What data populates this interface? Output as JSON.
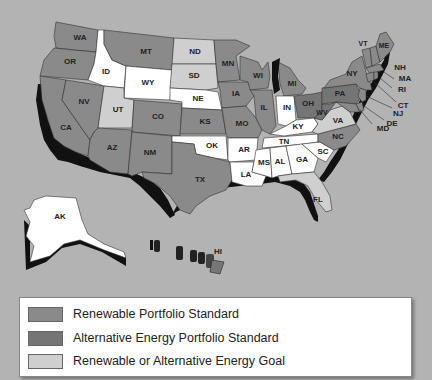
{
  "colors": {
    "background": "#b3b3b3",
    "rps": "#8a8a8a",
    "aeps": "#757575",
    "goal": "#cfcfcf",
    "none": "#ffffff",
    "shadow": "#111111"
  },
  "legend": {
    "items": [
      {
        "label": "Renewable Portfolio Standard",
        "category": "rps"
      },
      {
        "label": "Alternative Energy Portfolio Standard",
        "category": "aeps"
      },
      {
        "label": "Renewable or Alternative Energy Goal",
        "category": "goal"
      }
    ]
  },
  "states": {
    "WA": {
      "label": "WA",
      "category": "rps"
    },
    "OR": {
      "label": "OR",
      "category": "rps"
    },
    "CA": {
      "label": "CA",
      "category": "rps"
    },
    "NV": {
      "label": "NV",
      "category": "rps"
    },
    "ID": {
      "label": "ID",
      "category": "none"
    },
    "MT": {
      "label": "MT",
      "category": "rps"
    },
    "WY": {
      "label": "WY",
      "category": "none"
    },
    "UT": {
      "label": "UT",
      "category": "goal"
    },
    "AZ": {
      "label": "AZ",
      "category": "rps"
    },
    "CO": {
      "label": "CO",
      "category": "rps"
    },
    "NM": {
      "label": "NM",
      "category": "rps"
    },
    "ND": {
      "label": "ND",
      "category": "goal"
    },
    "SD": {
      "label": "SD",
      "category": "goal"
    },
    "NE": {
      "label": "NE",
      "category": "none"
    },
    "KS": {
      "label": "KS",
      "category": "rps"
    },
    "OK": {
      "label": "OK",
      "category": "none"
    },
    "TX": {
      "label": "TX",
      "category": "rps"
    },
    "MN": {
      "label": "MN",
      "category": "rps"
    },
    "IA": {
      "label": "IA",
      "category": "rps"
    },
    "MO": {
      "label": "MO",
      "category": "rps"
    },
    "AR": {
      "label": "AR",
      "category": "none"
    },
    "LA": {
      "label": "LA",
      "category": "none"
    },
    "WI": {
      "label": "WI",
      "category": "rps"
    },
    "IL": {
      "label": "IL",
      "category": "rps"
    },
    "MI": {
      "label": "MI",
      "category": "rps"
    },
    "IN": {
      "label": "IN",
      "category": "none"
    },
    "OH": {
      "label": "OH",
      "category": "aeps"
    },
    "KY": {
      "label": "KY",
      "category": "none"
    },
    "TN": {
      "label": "TN",
      "category": "none"
    },
    "MS": {
      "label": "MS",
      "category": "none"
    },
    "AL": {
      "label": "AL",
      "category": "none"
    },
    "GA": {
      "label": "GA",
      "category": "none"
    },
    "FL": {
      "label": "FL",
      "category": "goal"
    },
    "SC": {
      "label": "SC",
      "category": "none"
    },
    "NC": {
      "label": "NC",
      "category": "rps"
    },
    "VA": {
      "label": "VA",
      "category": "goal"
    },
    "WV": {
      "label": "WV",
      "category": "aeps"
    },
    "PA": {
      "label": "PA",
      "category": "aeps"
    },
    "NY": {
      "label": "NY",
      "category": "rps"
    },
    "VT": {
      "label": "VT",
      "category": "rps"
    },
    "ME": {
      "label": "ME",
      "category": "rps"
    },
    "NH": {
      "label": "NH",
      "category": "rps"
    },
    "MA": {
      "label": "MA",
      "category": "rps"
    },
    "RI": {
      "label": "RI",
      "category": "rps"
    },
    "CT": {
      "label": "CT",
      "category": "rps"
    },
    "NJ": {
      "label": "NJ",
      "category": "rps"
    },
    "DE": {
      "label": "DE",
      "category": "rps"
    },
    "MD": {
      "label": "MD",
      "category": "rps"
    },
    "AK": {
      "label": "AK",
      "category": "none"
    },
    "HI": {
      "label": "HI",
      "category": "rps"
    }
  }
}
